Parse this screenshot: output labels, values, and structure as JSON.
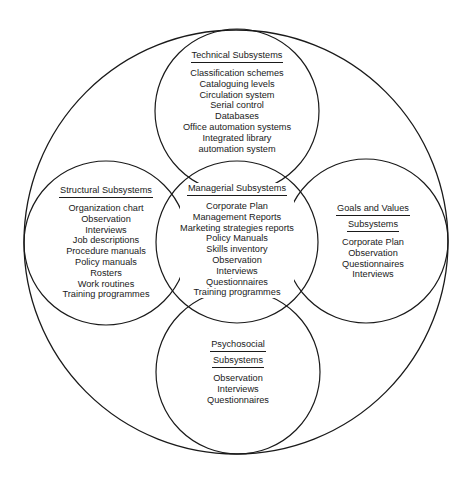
{
  "diagram": {
    "type": "nested-circle-venn",
    "outer": {
      "label": ""
    },
    "subsystems": [
      {
        "id": "technical",
        "heading": [
          "Technical Subsystems"
        ],
        "items": [
          "Classification schemes",
          "Cataloguing levels",
          "Circulation system",
          "Serial control",
          "Databases",
          "Office automation systems",
          "Integrated library",
          "automation system"
        ]
      },
      {
        "id": "structural",
        "heading": [
          "Structural Subsystems"
        ],
        "items": [
          "Organization chart",
          "Observation",
          "Interviews",
          "Job descriptions",
          "Procedure manuals",
          "Policy manuals",
          "Rosters",
          "Work routines",
          "Training programmes"
        ]
      },
      {
        "id": "managerial",
        "heading": [
          "Managerial Subsystems"
        ],
        "items": [
          "Corporate Plan",
          "Management Reports",
          "Marketing strategies reports",
          "Policy Manuals",
          "Skills inventory",
          "Observation",
          "Interviews",
          "Questionnaires",
          "Training programmes"
        ]
      },
      {
        "id": "goals",
        "heading": [
          "Goals and Values",
          "Subsystems"
        ],
        "items": [
          "Corporate Plan",
          "Observation",
          "Questionnaires",
          "Interviews"
        ]
      },
      {
        "id": "psychosocial",
        "heading": [
          "Psychosocial",
          "Subsystems"
        ],
        "items": [
          "Observation",
          "Interviews",
          "Questionnaires"
        ]
      }
    ]
  },
  "colors": {
    "line": "#1a1a1a",
    "background": "#ffffff",
    "text": "#1a1a1a"
  }
}
